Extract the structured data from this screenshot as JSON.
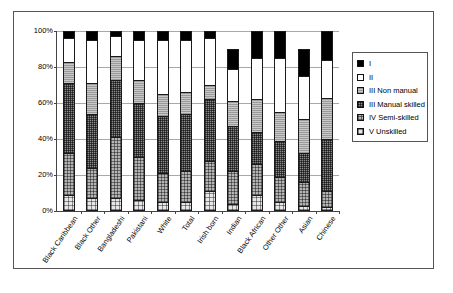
{
  "chart_data": {
    "type": "bar",
    "subtype": "stacked-100-percent",
    "title": "",
    "xlabel": "",
    "ylabel": "",
    "ylim": [
      0,
      100
    ],
    "ytick_labels": [
      "0%",
      "20%",
      "40%",
      "60%",
      "80%",
      "100%"
    ],
    "ytick_values": [
      0,
      20,
      40,
      60,
      80,
      100
    ],
    "grid": true,
    "legend_position": "right",
    "categories": [
      "Black Caribbean",
      "Black Other",
      "Bangladeshi",
      "Pakistani",
      "White",
      "Total",
      "Irish born",
      "Indian",
      "Black African",
      "Other Other",
      "Asian",
      "Chinese"
    ],
    "series": [
      {
        "name": "V Unskilled",
        "fill": "v-unskilled",
        "values": [
          9,
          7,
          7,
          6,
          5,
          5,
          11,
          4,
          9,
          5,
          3,
          2
        ]
      },
      {
        "name": "IV Semi-skilled",
        "fill": "iv-semi-skilled",
        "values": [
          23,
          17,
          34,
          24,
          16,
          17,
          17,
          18,
          17,
          14,
          13,
          9
        ]
      },
      {
        "name": "III Manual skilled",
        "fill": "iii-manual-skilled",
        "values": [
          39,
          30,
          32,
          30,
          32,
          32,
          34,
          25,
          18,
          20,
          16,
          29
        ]
      },
      {
        "name": "III Non manual",
        "fill": "iii-non-manual",
        "values": [
          12,
          17,
          13,
          13,
          12,
          12,
          8,
          14,
          18,
          16,
          19,
          23
        ]
      },
      {
        "name": "II",
        "fill": "ii",
        "values": [
          13,
          24,
          11,
          22,
          30,
          29,
          26,
          18,
          23,
          30,
          24,
          21
        ]
      },
      {
        "name": "I",
        "fill": "i",
        "values": [
          4,
          5,
          3,
          5,
          5,
          5,
          4,
          11,
          15,
          15,
          15,
          16
        ]
      }
    ],
    "legend": [
      {
        "label": "I",
        "fill": "i"
      },
      {
        "label": "II",
        "fill": "ii"
      },
      {
        "label": "III Non manual",
        "fill": "iii-non-manual"
      },
      {
        "label": "III Manual skilled",
        "fill": "iii-manual-skilled"
      },
      {
        "label": "IV Semi-skilled",
        "fill": "iv-semi-skilled"
      },
      {
        "label": "V Unskilled",
        "fill": "v-unskilled"
      }
    ],
    "colors": {
      "i": "#000000",
      "ii": "#ffffff",
      "iii-non-manual": "#9a9a9a",
      "iii-manual-skilled": "#8a8a8a",
      "iv-semi-skilled": "#b4b4b4",
      "v-unskilled": "#e6e6e6",
      "axis": "#444444",
      "gridline": "#a8a8a8",
      "frame": "#555555",
      "background": "#ffffff"
    }
  }
}
